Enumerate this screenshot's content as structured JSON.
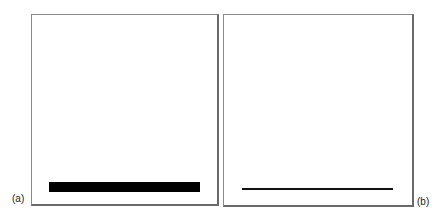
{
  "panels": [
    {
      "id": "a",
      "label": "(a)",
      "content": "thick horizontal bar"
    },
    {
      "id": "b",
      "label": "(b)",
      "content": "thin horizontal line"
    }
  ]
}
